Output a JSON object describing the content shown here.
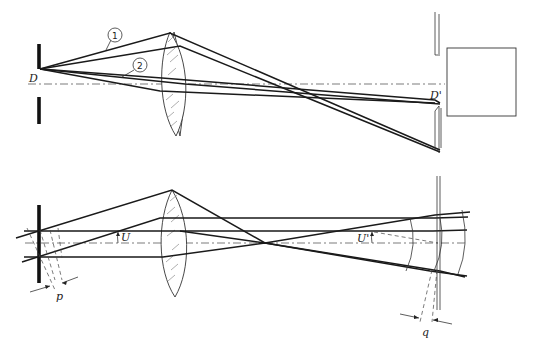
{
  "figure": {
    "top_diagram": {
      "labels": {
        "object_point": "D",
        "image_point": "D'",
        "ray_1": "1",
        "ray_2": "2"
      }
    },
    "bottom_diagram": {
      "labels": {
        "object_angle": "U",
        "image_angle": "U'",
        "object_pupil_width": "p",
        "image_pupil_width": "q"
      }
    },
    "caption": ""
  }
}
